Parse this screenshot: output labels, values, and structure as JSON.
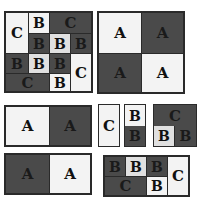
{
  "figure": {
    "panels": [
      {
        "id": "top-left-mosaic",
        "cells": [
          {
            "label": "C",
            "shade": "light"
          },
          {
            "label": "B",
            "shade": "light"
          },
          {
            "label": "C",
            "shade": "dark"
          },
          {
            "label": "B",
            "shade": "dark"
          },
          {
            "label": "B",
            "shade": "light"
          },
          {
            "label": "B",
            "shade": "dark"
          },
          {
            "label": "B",
            "shade": "dark"
          },
          {
            "label": "B",
            "shade": "light"
          },
          {
            "label": "B",
            "shade": "dark"
          },
          {
            "label": "C",
            "shade": "light"
          },
          {
            "label": "C",
            "shade": "dark"
          },
          {
            "label": "B",
            "shade": "light"
          }
        ]
      },
      {
        "id": "top-right-quad",
        "cells": [
          {
            "label": "A",
            "shade": "light"
          },
          {
            "label": "A",
            "shade": "dark"
          },
          {
            "label": "A",
            "shade": "dark"
          },
          {
            "label": "A",
            "shade": "light"
          }
        ]
      },
      {
        "id": "bottom-left-pair-1",
        "cells": [
          {
            "label": "A",
            "shade": "light"
          },
          {
            "label": "A",
            "shade": "dark"
          }
        ]
      },
      {
        "id": "bottom-left-pair-2",
        "cells": [
          {
            "label": "A",
            "shade": "dark"
          },
          {
            "label": "A",
            "shade": "light"
          }
        ]
      },
      {
        "id": "small-c",
        "cells": [
          {
            "label": "C",
            "shade": "light"
          }
        ]
      },
      {
        "id": "small-bb",
        "cells": [
          {
            "label": "B",
            "shade": "light"
          },
          {
            "label": "B",
            "shade": "dark"
          }
        ]
      },
      {
        "id": "small-cbb",
        "cells": [
          {
            "label": "C",
            "shade": "dark"
          },
          {
            "label": "B",
            "shade": "light"
          },
          {
            "label": "B",
            "shade": "dark"
          }
        ]
      },
      {
        "id": "bottom-right-mosaic",
        "cells": [
          {
            "label": "B",
            "shade": "dark"
          },
          {
            "label": "B",
            "shade": "light"
          },
          {
            "label": "B",
            "shade": "dark"
          },
          {
            "label": "C",
            "shade": "light"
          },
          {
            "label": "C",
            "shade": "dark"
          },
          {
            "label": "B",
            "shade": "light"
          }
        ]
      }
    ]
  }
}
